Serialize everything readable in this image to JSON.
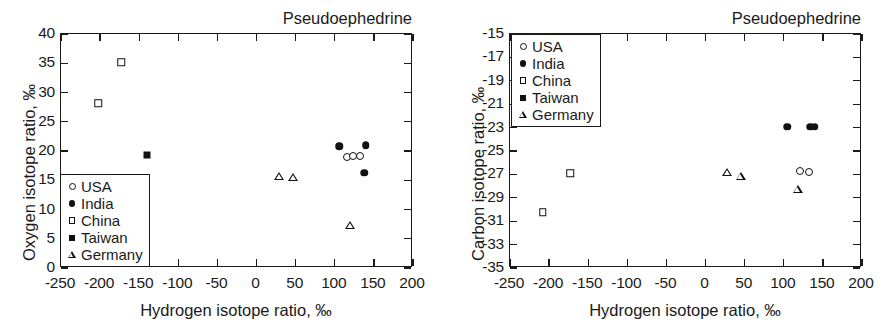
{
  "figure": {
    "width": 893,
    "height": 336,
    "background": "#ffffff",
    "ink_color": "#1a1a1a"
  },
  "legend_series": [
    {
      "key": "usa",
      "label": "USA",
      "marker": "circle-open"
    },
    {
      "key": "india",
      "label": "India",
      "marker": "circle-filled"
    },
    {
      "key": "china",
      "label": "China",
      "marker": "square-open"
    },
    {
      "key": "taiwan",
      "label": "Taiwan",
      "marker": "square-filled"
    },
    {
      "key": "germany",
      "label": "Germany",
      "marker": "triangle-open"
    }
  ],
  "chart_data": [
    {
      "id": "oxygen-vs-hydrogen",
      "type": "scatter",
      "title": "Pseudoephedrine",
      "xlabel": "Hydrogen isotope ratio, ‰",
      "ylabel": "Oxygen isotope ratio, ‰",
      "xlim": [
        -250,
        200
      ],
      "ylim": [
        0,
        40
      ],
      "xticks": [
        -250,
        -200,
        -150,
        -100,
        -50,
        0,
        50,
        100,
        150,
        200
      ],
      "xticklabels": [
        "-250",
        "-200",
        "-150",
        "-100",
        "-50",
        "0",
        "50",
        "100",
        "150",
        "200"
      ],
      "yticks": [
        0,
        5,
        10,
        15,
        20,
        25,
        30,
        35,
        40
      ],
      "yticklabels": [
        "0",
        "5",
        "10",
        "15",
        "20",
        "25",
        "30",
        "35",
        "40"
      ],
      "grid": false,
      "legend_position": "lower-left",
      "series": [
        {
          "name": "USA",
          "marker": "circle-open",
          "points": [
            [
              117,
              18.8
            ],
            [
              124,
              18.9
            ],
            [
              134,
              19.0
            ]
          ]
        },
        {
          "name": "India",
          "marker": "circle-filled",
          "points": [
            [
              107,
              20.6
            ],
            [
              141,
              20.8
            ],
            [
              139,
              16.1
            ]
          ]
        },
        {
          "name": "China",
          "marker": "square-open",
          "points": [
            [
              -172,
              35.0
            ],
            [
              -201,
              28.0
            ]
          ]
        },
        {
          "name": "Taiwan",
          "marker": "square-filled",
          "points": [
            [
              -139,
              19.2
            ]
          ]
        },
        {
          "name": "Germany",
          "marker": "triangle-open",
          "points": [
            [
              30,
              15.5
            ],
            [
              48,
              16.7
            ],
            [
              121,
              9.9
            ]
          ]
        }
      ]
    },
    {
      "id": "carbon-vs-hydrogen",
      "type": "scatter",
      "title": "Pseudoephedrine",
      "xlabel": "Hydrogen isotope ratio, ‰",
      "ylabel": "Carbon isotope ratio, ‰",
      "xlim": [
        -250,
        200
      ],
      "ylim": [
        -35,
        -15
      ],
      "xticks": [
        -250,
        -200,
        -150,
        -100,
        -50,
        0,
        50,
        100,
        150,
        200
      ],
      "xticklabels": [
        "-250",
        "-200",
        "-150",
        "-100",
        "-50",
        "0",
        "50",
        "100",
        "150",
        "200"
      ],
      "yticks": [
        -35,
        -33,
        -31,
        -29,
        -27,
        -25,
        -23,
        -21,
        -19,
        -17,
        -15
      ],
      "yticklabels": [
        "-35",
        "-33",
        "-31",
        "-29",
        "-27",
        "-25",
        "-23",
        "-21",
        "-19",
        "-17",
        "-15"
      ],
      "grid": false,
      "legend_position": "upper-left",
      "series": [
        {
          "name": "USA",
          "marker": "circle-open",
          "points": [
            [
              122,
              -26.8
            ],
            [
              133,
              -26.9
            ]
          ]
        },
        {
          "name": "India",
          "marker": "circle-filled",
          "points": [
            [
              106,
              -23.0
            ],
            [
              135,
              -23.0
            ],
            [
              141,
              -23.0
            ]
          ]
        },
        {
          "name": "China",
          "marker": "square-open",
          "points": [
            [
              -172,
              -27.0
            ],
            [
              -207,
              -30.3
            ]
          ]
        },
        {
          "name": "Taiwan",
          "marker": "square-filled",
          "points": []
        },
        {
          "name": "Germany",
          "marker": "triangle-open",
          "points": [
            [
              29,
              -26.9
            ],
            [
              46,
              -26.5
            ],
            [
              119,
              -27.0
            ]
          ]
        }
      ]
    }
  ]
}
